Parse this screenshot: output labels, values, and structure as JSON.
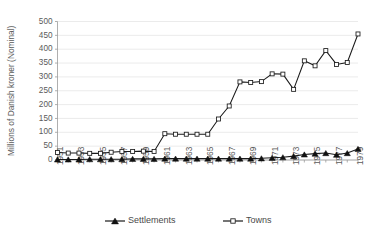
{
  "chart_data": {
    "type": "line",
    "title": "",
    "xlabel": "",
    "ylabel": "Millions of Danish kroner (Nominal)",
    "ylim": [
      0,
      500
    ],
    "ytick_step": 50,
    "yticks": [
      0,
      50,
      100,
      150,
      200,
      250,
      300,
      350,
      400,
      450,
      500
    ],
    "grid": true,
    "legend_position": "bottom",
    "x": [
      1951,
      1952,
      1953,
      1954,
      1955,
      1956,
      1957,
      1958,
      1959,
      1960,
      1961,
      1962,
      1963,
      1964,
      1965,
      1966,
      1967,
      1968,
      1969,
      1970,
      1971,
      1972,
      1973,
      1974,
      1975,
      1976,
      1977,
      1978,
      1979
    ],
    "xtick_labels": [
      "1951",
      "1953",
      "1955",
      "1957",
      "1959",
      "1961",
      "1963",
      "1965",
      "1967",
      "1969",
      "1971",
      "1973",
      "1975",
      "1977",
      "1979"
    ],
    "xtick_values": [
      1951,
      1953,
      1955,
      1957,
      1959,
      1961,
      1963,
      1965,
      1967,
      1969,
      1971,
      1973,
      1975,
      1977,
      1979
    ],
    "series": [
      {
        "name": "Settlements",
        "marker": "triangle",
        "color": "#111111",
        "values": [
          2,
          2,
          2,
          3,
          3,
          3,
          3,
          4,
          4,
          4,
          5,
          5,
          5,
          5,
          5,
          5,
          5,
          5,
          5,
          6,
          8,
          10,
          14,
          20,
          23,
          25,
          19,
          25,
          40
        ]
      },
      {
        "name": "Towns",
        "marker": "square",
        "color": "#111111",
        "values": [
          27,
          25,
          25,
          24,
          24,
          28,
          31,
          31,
          32,
          31,
          95,
          93,
          93,
          93,
          93,
          148,
          195,
          282,
          280,
          283,
          311,
          310,
          255,
          358,
          340,
          395,
          345,
          352,
          455
        ]
      }
    ]
  },
  "legend": {
    "items": [
      {
        "label": "Settlements",
        "marker": "triangle"
      },
      {
        "label": "Towns",
        "marker": "square"
      }
    ]
  }
}
